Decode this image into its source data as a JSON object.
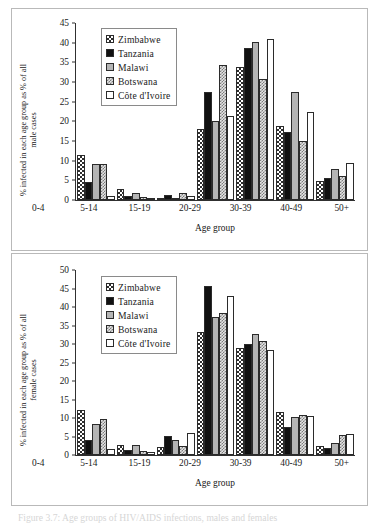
{
  "figure": {
    "caption": "Figure 3.7: Age groups of HIV/AIDS infections, males and females"
  },
  "series_styles": {
    "Zimbabwe": "s-zimbabwe",
    "Tanzania": "s-tanzania",
    "Malawi": "s-malawi",
    "Botswana": "s-botswana",
    "Côte d'Ivoire": "s-cote"
  },
  "panels": {
    "male": {
      "ylabel_line1": "% infected in each age group as % of all",
      "ylabel_line2": "male cases",
      "xlabel": "Age group",
      "legend": [
        "Zimbabwe",
        "Tanzania",
        "Malawi",
        "Botswana",
        "Côte d'Ivoire"
      ]
    },
    "female": {
      "ylabel_line1": "% infected in each age group as % of all",
      "ylabel_line2": "female cases",
      "xlabel": "Age group",
      "legend": [
        "Zimbabwe",
        "Tanzania",
        "Malawi",
        "Botswana",
        "Côte d'Ivoire"
      ]
    }
  },
  "chart_data": [
    {
      "id": "male",
      "type": "bar",
      "title": "% infected in each age group as % of all male cases",
      "xlabel": "Age group",
      "ylabel": "% infected in each age group as % of all male cases",
      "categories": [
        "0-4",
        "5-14",
        "15-19",
        "20-29",
        "30-39",
        "40-49",
        "50+"
      ],
      "ylim": [
        0,
        45
      ],
      "yticks": [
        0,
        5,
        10,
        15,
        20,
        25,
        30,
        35,
        40,
        45
      ],
      "grid": false,
      "legend_position": "upper-left",
      "series": [
        {
          "name": "Zimbabwe",
          "values": [
            11.4,
            2.9,
            0.4,
            18.1,
            33.9,
            18.8,
            4.8
          ]
        },
        {
          "name": "Tanzania",
          "values": [
            4.7,
            1.0,
            1.3,
            27.5,
            38.8,
            17.3,
            5.6
          ]
        },
        {
          "name": "Malawi",
          "values": [
            9.3,
            1.7,
            0.3,
            20.2,
            40.3,
            27.7,
            7.9
          ]
        },
        {
          "name": "Botswana",
          "values": [
            9.3,
            0.8,
            1.8,
            34.6,
            31.0,
            15.0,
            6.1
          ]
        },
        {
          "name": "Côte d'Ivoire",
          "values": [
            1.1,
            0.5,
            0.9,
            21.4,
            41.1,
            22.6,
            9.5
          ]
        }
      ]
    },
    {
      "id": "female",
      "type": "bar",
      "title": "% infected in each age group as % of all female cases",
      "xlabel": "Age group",
      "ylabel": "% infected in each age group as % of all female cases",
      "categories": [
        "0-4",
        "5-14",
        "15-19",
        "20-29",
        "30-39",
        "40-49",
        "50+"
      ],
      "ylim": [
        0,
        50
      ],
      "yticks": [
        0,
        5,
        10,
        15,
        20,
        25,
        30,
        35,
        40,
        45,
        50
      ],
      "grid": false,
      "legend_position": "upper-left",
      "series": [
        {
          "name": "Zimbabwe",
          "values": [
            12.3,
            2.8,
            2.3,
            33.3,
            29.0,
            11.7,
            2.4
          ]
        },
        {
          "name": "Tanzania",
          "values": [
            4.2,
            1.3,
            5.3,
            46.0,
            30.3,
            7.6,
            1.9
          ]
        },
        {
          "name": "Malawi",
          "values": [
            8.5,
            2.8,
            4.0,
            37.6,
            33.0,
            10.3,
            3.2
          ]
        },
        {
          "name": "Botswana",
          "values": [
            9.7,
            1.2,
            2.5,
            38.5,
            30.9,
            10.9,
            5.4
          ]
        },
        {
          "name": "Côte d'Ivoire",
          "values": [
            1.6,
            0.7,
            5.9,
            43.1,
            28.6,
            10.7,
            5.7
          ]
        }
      ]
    }
  ]
}
